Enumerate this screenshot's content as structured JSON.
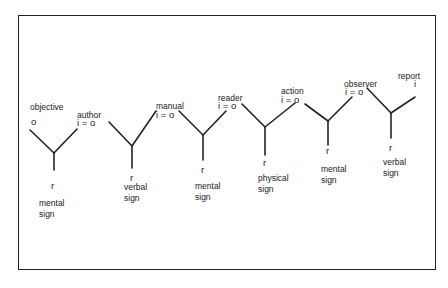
{
  "diagram": {
    "title": "",
    "stroke_color": "#222222",
    "nodes": [
      {
        "id": "objective",
        "role_label": "objective",
        "top_symbol": "o",
        "bottom_symbol": "r",
        "sign_line1": "mental",
        "sign_line2": "sign"
      },
      {
        "id": "author",
        "role_label": "author",
        "top_symbol": "i  =  o",
        "bottom_symbol": "r",
        "sign_line1": "verbal",
        "sign_line2": "sign"
      },
      {
        "id": "manual",
        "role_label": "manual",
        "top_symbol": "i  =  o",
        "bottom_symbol": "r",
        "sign_line1": "mental",
        "sign_line2": "sign"
      },
      {
        "id": "reader",
        "role_label": "reader",
        "top_symbol": "i = o",
        "bottom_symbol": "r",
        "sign_line1": "physical",
        "sign_line2": "sign"
      },
      {
        "id": "action",
        "role_label": "action",
        "top_symbol": "i = o",
        "bottom_symbol": "r",
        "sign_line1": "mental",
        "sign_line2": "sign"
      },
      {
        "id": "observer",
        "role_label": "observer",
        "top_symbol": "i = o",
        "bottom_symbol": "r",
        "sign_line1": "verbal",
        "sign_line2": "sign"
      },
      {
        "id": "report",
        "role_label": "report",
        "top_symbol": "i"
      }
    ]
  }
}
